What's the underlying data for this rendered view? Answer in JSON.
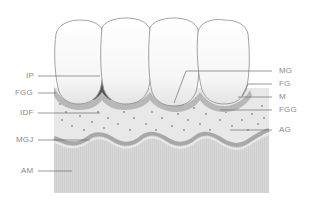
{
  "diagram": {
    "type": "dental gingiva anatomy illustration",
    "colors": {
      "background": "#ffffff",
      "tooth_fill": "#f7f7f7",
      "tooth_outline": "#8c8c8c",
      "interdental_dark": "#5a5a5a",
      "gingiva_band": "#b4b4b4",
      "attached_gingiva": "#e6e6e6",
      "stipple_dots": "#8a8a8a",
      "mgj_band": "#a8a8a8",
      "alveolar_mucosa": "#d6d6d6",
      "leader_line": "#6e6e6e",
      "label_text": "#8a8a8a"
    },
    "labels_left": [
      {
        "id": "IP",
        "text": "IP"
      },
      {
        "id": "FGG",
        "text": "FGG"
      },
      {
        "id": "IDF",
        "text": "IDF"
      },
      {
        "id": "MGJ",
        "text": "MGJ"
      },
      {
        "id": "AM",
        "text": "AM"
      }
    ],
    "labels_right": [
      {
        "id": "MG",
        "text": "MG"
      },
      {
        "id": "FG",
        "text": "FG"
      },
      {
        "id": "M",
        "text": "M"
      },
      {
        "id": "FGG",
        "text": "FGG"
      },
      {
        "id": "AG",
        "text": "AG"
      }
    ]
  }
}
